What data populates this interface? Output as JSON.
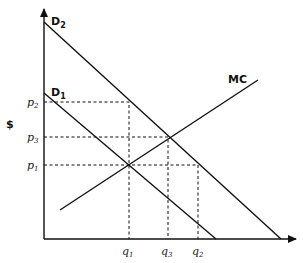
{
  "diagram": {
    "type": "supply-demand",
    "y_axis_label": "$",
    "curves": {
      "d2": {
        "label": "D",
        "sub": "2"
      },
      "d1": {
        "label": "D",
        "sub": "1"
      },
      "mc": {
        "label": "MC"
      }
    },
    "price_labels": [
      {
        "label": "p",
        "sub": "2"
      },
      {
        "label": "p",
        "sub": "3"
      },
      {
        "label": "p",
        "sub": "1"
      }
    ],
    "quantity_labels": [
      {
        "label": "q",
        "sub": "1"
      },
      {
        "label": "q",
        "sub": "3"
      },
      {
        "label": "q",
        "sub": "2"
      }
    ]
  }
}
